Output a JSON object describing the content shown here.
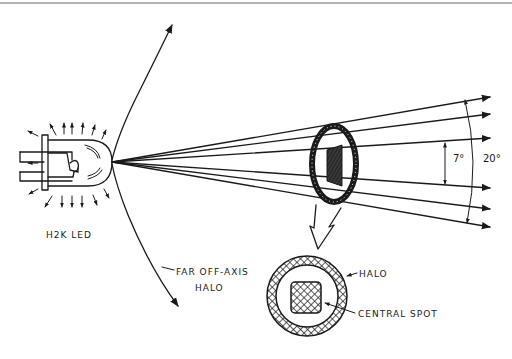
{
  "figure": {
    "type": "line-drawing",
    "labels": {
      "led": "H2K LED",
      "far_off_axis_line1": "FAR OFF-AXIS",
      "far_off_axis_line2": "HALO",
      "halo": "HALO",
      "central_spot": "CENTRAL SPOT",
      "inner_angle": "7°",
      "outer_angle": "20°"
    },
    "beam": {
      "origin": [
        112,
        162
      ],
      "ray_endpoints_y": [
        97,
        114,
        138,
        188,
        209,
        227
      ],
      "ray_endpoint_x": 490
    },
    "colors": {
      "ink": "#1a1a1a",
      "background": "#ffffff",
      "top_rule": "#9a9a9a"
    }
  }
}
